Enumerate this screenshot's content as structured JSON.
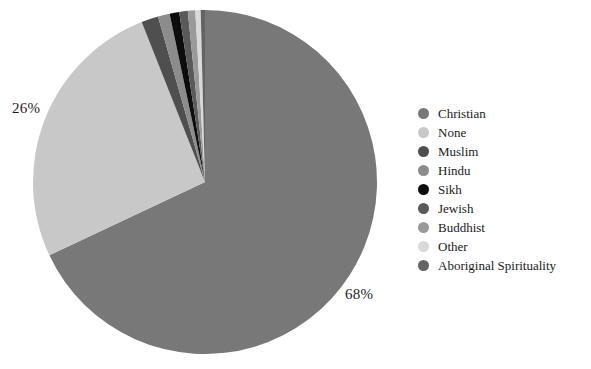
{
  "chart_data": {
    "type": "pie",
    "title": "",
    "legend_position": "right",
    "categories": [
      "Christian",
      "None",
      "Muslim",
      "Hindu",
      "Sikh",
      "Jewish",
      "Buddhist",
      "Other",
      "Aboriginal Spirituality"
    ],
    "values": [
      68,
      26,
      1.6,
      1.1,
      0.9,
      0.8,
      0.7,
      0.5,
      0.4
    ],
    "value_unit": "%",
    "colors": [
      "#787878",
      "#c8c8c8",
      "#4f4f4f",
      "#8c8c8c",
      "#0d0d0d",
      "#5a5a5a",
      "#9a9a9a",
      "#d9d9d9",
      "#636363"
    ],
    "labels": [
      {
        "text": "68%",
        "category": "Christian"
      },
      {
        "text": "26%",
        "category": "None"
      }
    ],
    "start_angle_deg": 0,
    "direction": "clockwise",
    "background": "#ffffff"
  },
  "legend": {
    "items": [
      {
        "label": "Christian",
        "color": "#787878"
      },
      {
        "label": "None",
        "color": "#c8c8c8"
      },
      {
        "label": "Muslim",
        "color": "#4f4f4f"
      },
      {
        "label": "Hindu",
        "color": "#8c8c8c"
      },
      {
        "label": "Sikh",
        "color": "#0d0d0d"
      },
      {
        "label": "Jewish",
        "color": "#5a5a5a"
      },
      {
        "label": "Buddhist",
        "color": "#9a9a9a"
      },
      {
        "label": "Other",
        "color": "#d9d9d9"
      },
      {
        "label": "Aboriginal Spirituality",
        "color": "#636363"
      }
    ]
  },
  "pie": {
    "center_x": 205,
    "center_y": 182,
    "radius": 172,
    "label_christian": "68%",
    "label_none": "26%"
  }
}
